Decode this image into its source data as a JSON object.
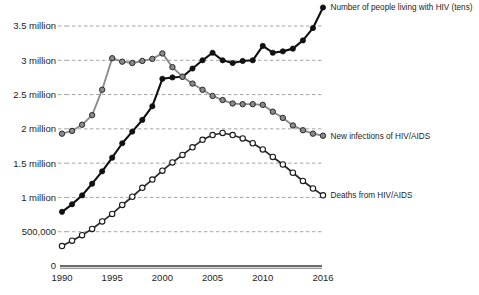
{
  "chart_data": {
    "type": "line",
    "title": "",
    "subtitle": "",
    "xlabel": "",
    "ylabel": "",
    "x": [
      1990,
      1991,
      1992,
      1993,
      1994,
      1995,
      1996,
      1997,
      1998,
      1999,
      2000,
      2001,
      2002,
      2003,
      2004,
      2005,
      2006,
      2007,
      2008,
      2009,
      2010,
      2011,
      2012,
      2013,
      2014,
      2015,
      2016
    ],
    "xlim": [
      1990,
      2016
    ],
    "ylim": [
      0,
      3800000
    ],
    "xticks": [
      1990,
      1995,
      2000,
      2005,
      2010,
      2016
    ],
    "xtick_labels": [
      "1990",
      "1995",
      "2000",
      "2005",
      "2010",
      "2016"
    ],
    "yticks": [
      0,
      500000,
      1000000,
      1500000,
      2000000,
      2500000,
      3000000,
      3500000
    ],
    "ytick_labels": [
      "0",
      "500,000",
      "1 million",
      "1.5 million",
      "2 million",
      "2.5 million",
      "3 million",
      "3.5 million"
    ],
    "grid": true,
    "legend_position": "right-inline",
    "series": [
      {
        "name": "Number of people living with HIV (tens)",
        "label_at_x": 2016,
        "marker": "filled-circle",
        "color": "#111111",
        "marker_fill": "#111111",
        "values": [
          790000,
          900000,
          1030000,
          1200000,
          1380000,
          1580000,
          1790000,
          1960000,
          2130000,
          2330000,
          2730000,
          2750000,
          2760000,
          2880000,
          3000000,
          3110000,
          3000000,
          2960000,
          2990000,
          3000000,
          3210000,
          3110000,
          3130000,
          3170000,
          3290000,
          3470000,
          3770000
        ]
      },
      {
        "name": "New infections of HIV/AIDS",
        "label_at_x": 2016,
        "marker": "gray-circle",
        "color": "#777777",
        "marker_fill": "#8a8a8a",
        "values": [
          1930000,
          1970000,
          2060000,
          2200000,
          2570000,
          3030000,
          2980000,
          2960000,
          2990000,
          3020000,
          3100000,
          2900000,
          2760000,
          2660000,
          2570000,
          2480000,
          2420000,
          2370000,
          2360000,
          2360000,
          2350000,
          2250000,
          2160000,
          2050000,
          1980000,
          1930000,
          1900000
        ]
      },
      {
        "name": "Deaths from HIV/AIDS",
        "label_at_x": 2016,
        "marker": "hollow-circle",
        "color": "#1a1a1a",
        "marker_fill": "#ffffff",
        "values": [
          290000,
          370000,
          450000,
          540000,
          650000,
          760000,
          890000,
          1010000,
          1140000,
          1260000,
          1390000,
          1510000,
          1620000,
          1730000,
          1840000,
          1910000,
          1940000,
          1910000,
          1860000,
          1790000,
          1700000,
          1590000,
          1480000,
          1360000,
          1240000,
          1130000,
          1030000
        ]
      }
    ]
  },
  "legend": {
    "items": [
      {
        "label": "Number of people living with HIV (tens)"
      },
      {
        "label": "New infections of HIV/AIDS"
      },
      {
        "label": "Deaths from HIV/AIDS"
      }
    ]
  }
}
